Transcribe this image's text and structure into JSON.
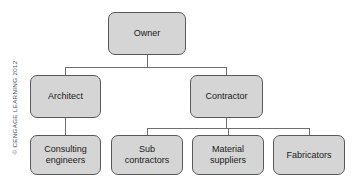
{
  "diagram": {
    "type": "org-chart",
    "colors": {
      "node_fill": "#d5d5d5",
      "node_border": "#58595b",
      "connector": "#6e6f71",
      "background": "#ffffff",
      "text": "#1a1a1a",
      "copyright_text": "#4a4a4a"
    },
    "nodes": {
      "owner": "Owner",
      "architect": "Architect",
      "contractor": "Contractor",
      "consulting_engineers": "Consulting\nengineers",
      "sub_contractors": "Sub\ncontractors",
      "material_suppliers": "Material\nsuppliers",
      "fabricators": "Fabricators"
    },
    "levels": [
      [
        "Owner"
      ],
      [
        "Architect",
        "Contractor"
      ],
      [
        "Consulting engineers",
        "Sub contractors",
        "Material suppliers",
        "Fabricators"
      ]
    ],
    "edges": [
      {
        "from": "Owner",
        "to": "Architect"
      },
      {
        "from": "Owner",
        "to": "Contractor"
      },
      {
        "from": "Architect",
        "to": "Consulting engineers"
      },
      {
        "from": "Contractor",
        "to": "Sub contractors"
      },
      {
        "from": "Contractor",
        "to": "Material suppliers"
      },
      {
        "from": "Contractor",
        "to": "Fabricators"
      }
    ]
  },
  "copyright": {
    "text": "© CENGAGE LEARNING 2012"
  }
}
